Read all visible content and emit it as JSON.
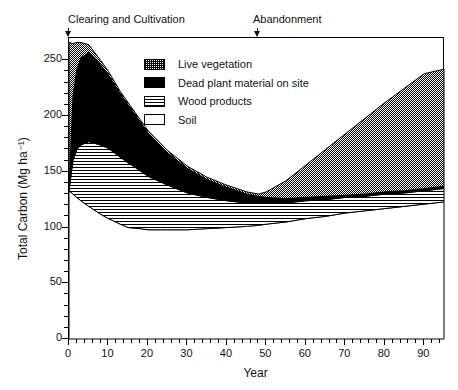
{
  "figure": {
    "cropped_caption_fragment": "",
    "annotations": [
      {
        "name": "clearing",
        "label": "Clearing and Cultivation",
        "year": 0
      },
      {
        "name": "abandonment",
        "label": "Abandonment",
        "year": 48
      }
    ]
  },
  "legend": {
    "position": "inside-top-center",
    "items": [
      {
        "key": "live",
        "label": "Live vegetation",
        "pattern": "checkered"
      },
      {
        "key": "dead",
        "label": "Dead plant material on site",
        "pattern": "solid-black"
      },
      {
        "key": "wood",
        "label": "Wood products",
        "pattern": "horizontal-lines"
      },
      {
        "key": "soil",
        "label": "Soil",
        "pattern": "white"
      }
    ]
  },
  "chart_data": {
    "type": "area",
    "stacked": true,
    "title": "",
    "xlabel": "Year",
    "ylabel": "Total Carbon  (Mg ha⁻¹)",
    "xlim": [
      0,
      95
    ],
    "ylim": [
      0,
      270
    ],
    "xticks": [
      0,
      10,
      20,
      30,
      40,
      50,
      60,
      70,
      80,
      90
    ],
    "yticks": [
      0,
      50,
      100,
      150,
      200,
      250
    ],
    "xminor_step": 2,
    "yminor_step": 10,
    "grid": false,
    "x": [
      0,
      1,
      2,
      3,
      5,
      8,
      10,
      13,
      15,
      18,
      20,
      25,
      30,
      35,
      40,
      45,
      48,
      50,
      55,
      60,
      65,
      70,
      75,
      80,
      85,
      90,
      95
    ],
    "series": [
      {
        "name": "Soil",
        "key": "soil",
        "pattern": "white",
        "values": [
          133,
          130,
          127,
          124,
          119,
          112,
          108,
          103,
          100,
          99,
          98,
          98,
          98,
          99,
          100,
          101,
          102,
          103,
          105,
          108,
          110,
          113,
          115,
          117,
          119,
          121,
          123
        ]
      },
      {
        "name": "Wood products",
        "key": "wood",
        "pattern": "horizontal-lines",
        "values": [
          0,
          30,
          43,
          50,
          58,
          62,
          63,
          60,
          58,
          52,
          48,
          40,
          33,
          28,
          24,
          21,
          20,
          19,
          17,
          16,
          15,
          14,
          13,
          13,
          12,
          12,
          12
        ]
      },
      {
        "name": "Dead plant material on site",
        "key": "dead",
        "pattern": "solid-black",
        "values": [
          0,
          58,
          72,
          78,
          80,
          72,
          66,
          57,
          52,
          44,
          39,
          29,
          22,
          16,
          12,
          8,
          6,
          5,
          4,
          3,
          3,
          2,
          2,
          2,
          2,
          2,
          2
        ]
      },
      {
        "name": "Live vegetation",
        "key": "live",
        "pattern": "checkered",
        "values": [
          133,
          47,
          24,
          14,
          7,
          4,
          3,
          2,
          2,
          2,
          2,
          2,
          2,
          2,
          2,
          2,
          2,
          5,
          16,
          29,
          42,
          55,
          68,
          80,
          92,
          103,
          105
        ]
      }
    ],
    "total_top": [
      266,
      265,
      266,
      266,
      264,
      250,
      240,
      222,
      212,
      197,
      187,
      169,
      155,
      145,
      138,
      132,
      130,
      132,
      142,
      156,
      170,
      184,
      198,
      212,
      225,
      238,
      242
    ]
  },
  "colors": {
    "ink": "#000000",
    "background": "#ffffff"
  }
}
